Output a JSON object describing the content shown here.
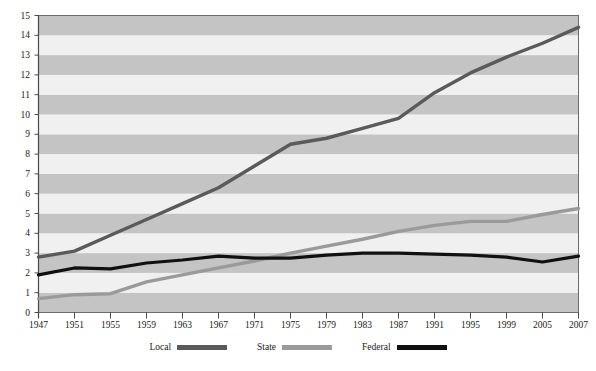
{
  "chart_data": {
    "type": "line",
    "title": "",
    "xlabel": "",
    "ylabel": "",
    "xlim": [
      1947,
      2007
    ],
    "ylim": [
      0,
      15
    ],
    "grid": "horizontal-banded",
    "legend_position": "bottom-center",
    "x_tick_labels": [
      "1947",
      "1951",
      "1955",
      "1959",
      "1963",
      "1967",
      "1971",
      "1975",
      "1979",
      "1983",
      "1987",
      "1991",
      "1995",
      "1999",
      "2005",
      "2007"
    ],
    "y_tick_labels": [
      "0",
      "1",
      "2",
      "3",
      "4",
      "5",
      "6",
      "7",
      "8",
      "9",
      "10",
      "11",
      "12",
      "13",
      "14",
      "15"
    ],
    "x": [
      1947,
      1951,
      1955,
      1959,
      1963,
      1967,
      1971,
      1975,
      1979,
      1983,
      1987,
      1991,
      1995,
      1999,
      2005,
      2007
    ],
    "series": [
      {
        "name": "Local",
        "color": "#5a5a5a",
        "values": [
          2.8,
          3.1,
          3.9,
          4.7,
          5.5,
          6.3,
          7.4,
          8.5,
          8.8,
          9.3,
          9.8,
          11.1,
          12.1,
          12.9,
          13.6,
          14.4
        ]
      },
      {
        "name": "State",
        "color": "#9a9a9a",
        "values": [
          0.7,
          0.9,
          0.95,
          1.55,
          1.9,
          2.25,
          2.6,
          3.0,
          3.35,
          3.7,
          4.1,
          4.4,
          4.6,
          4.6,
          4.95,
          5.25
        ]
      },
      {
        "name": "Federal",
        "color": "#101010",
        "values": [
          1.9,
          2.25,
          2.2,
          2.5,
          2.65,
          2.85,
          2.75,
          2.75,
          2.9,
          3.0,
          3.0,
          2.95,
          2.9,
          2.8,
          2.55,
          2.85
        ]
      }
    ]
  },
  "legend": {
    "items": [
      {
        "label": "Local",
        "color": "#5a5a5a"
      },
      {
        "label": "State",
        "color": "#9a9a9a"
      },
      {
        "label": "Federal",
        "color": "#101010"
      }
    ]
  },
  "plot": {
    "band_light": "#f0f0f0",
    "band_dark": "#c4c4c4",
    "border_color": "#6b6b6b",
    "axis_color": "#4a4a4a"
  }
}
